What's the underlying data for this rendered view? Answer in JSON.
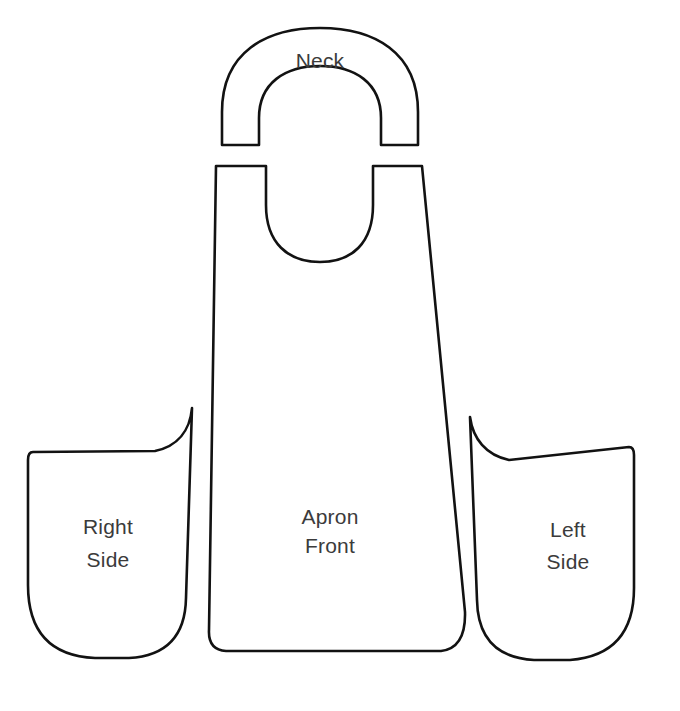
{
  "document": {
    "kind": "apron-sewing-pattern-diagram",
    "background_color": "#ffffff",
    "outline_color": "#121212",
    "label_color": "#3b3b3b",
    "canvas": {
      "width": 680,
      "height": 711
    }
  },
  "pieces": {
    "neck": {
      "label": "Neck",
      "label_x": 320,
      "label_y": 62
    },
    "apron_front": {
      "label_line1": "Apron",
      "label_line2": "Front",
      "label_x": 330,
      "label_y1": 518,
      "label_y2": 547
    },
    "right_side": {
      "label_line1": "Right",
      "label_line2": "Side",
      "label_x": 108,
      "label_y1": 528,
      "label_y2": 561
    },
    "left_side": {
      "label_line1": "Left",
      "label_line2": "Side",
      "label_x": 568,
      "label_y1": 531,
      "label_y2": 563
    }
  },
  "shapes": {
    "neck_path": "M 222 145 L 222 112 C 222 52 266 28 320 28 C 374 28 418 52 418 112 L 418 145 L 381 145 L 381 118 C 381 83 355 66 320 66 C 285 66 259 83 259 118 L 259 145 Z",
    "apron_front_path": "M 216 166 L 266 166 L 266 205 C 266 243 288 262 320 262 C 352 262 373 243 373 205 L 373 166 L 422 166 L 465 612 Q 466 648 441 651 L 226 651 Q 208 650 209 630 L 216 166 Z",
    "right_side_path": "M 192 408 C 190 430 178 446 155 451 L 33 452 Q 28 452 28 460 L 28 585 Q 28 655 95 658 L 129 658 Q 185 655 186 598 L 192 408 Z",
    "left_side_path": "M 470 417 C 473 439 486 455 509 460 L 629 447 Q 634 447 634 455 L 634 588 Q 634 655 570 660 L 534 660 Q 478 657 477 600 L 470 417 Z"
  }
}
